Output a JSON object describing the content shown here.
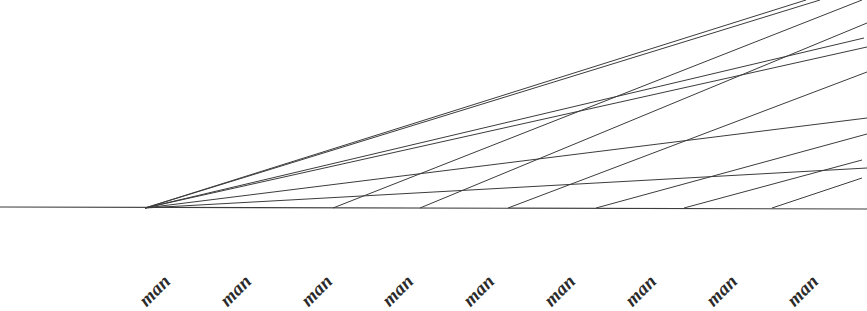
{
  "figure": {
    "title": "",
    "background_color": "#ffffff",
    "line_color": "#3c3c3c",
    "text_color": "#2b2b2b",
    "width": 867,
    "height": 289
  },
  "axis": {
    "name": "category-axis",
    "orientation": "horizontal",
    "baseline_y": 207,
    "label_rotation_deg": -45,
    "tick_labels": [
      {
        "text": "man",
        "x": 150,
        "y": 289
      },
      {
        "text": "man",
        "x": 231,
        "y": 289
      },
      {
        "text": "man",
        "x": 312,
        "y": 289
      },
      {
        "text": "man",
        "x": 393,
        "y": 289
      },
      {
        "text": "man",
        "x": 474,
        "y": 289
      },
      {
        "text": "man",
        "x": 555,
        "y": 289
      },
      {
        "text": "man",
        "x": 636,
        "y": 289
      },
      {
        "text": "man",
        "x": 717,
        "y": 289
      },
      {
        "text": "man",
        "x": 798,
        "y": 289
      }
    ]
  },
  "chart_data": {
    "type": "line",
    "title": "",
    "subtitle": "",
    "xlabel": "",
    "ylabel": "",
    "grid": false,
    "legend": "none",
    "xlim": [
      0,
      867
    ],
    "ylim": [
      0,
      289
    ],
    "categories": [
      "man",
      "man",
      "man",
      "man",
      "man",
      "man",
      "man",
      "man",
      "man"
    ],
    "series": [
      {
        "name": "baseline",
        "role": "axis-baseline",
        "points": [
          [
            0,
            207
          ],
          [
            867,
            209
          ]
        ]
      },
      {
        "name": "fan-line-1",
        "role": "near-horizontal-mesh",
        "points": [
          [
            145,
            208
          ],
          [
            867,
            168
          ]
        ]
      },
      {
        "name": "fan-line-2",
        "role": "near-horizontal-mesh",
        "points": [
          [
            145,
            208
          ],
          [
            867,
            118
          ]
        ]
      },
      {
        "name": "fan-line-3",
        "role": "near-horizontal-mesh",
        "points": [
          [
            145,
            208
          ],
          [
            867,
            47
          ]
        ]
      },
      {
        "name": "fan-line-4",
        "role": "near-horizontal-mesh",
        "points": [
          [
            145,
            208
          ],
          [
            864,
            38
          ]
        ]
      },
      {
        "name": "fan-line-5",
        "role": "near-horizontal-mesh-steep",
        "points": [
          [
            145,
            208
          ],
          [
            820,
            0
          ]
        ]
      },
      {
        "name": "fan-line-6",
        "role": "near-horizontal-mesh-steep",
        "points": [
          [
            145,
            208
          ],
          [
            806,
            0
          ]
        ]
      },
      {
        "name": "rib-line-1",
        "role": "steep-mesh",
        "points": [
          [
            333,
            208
          ],
          [
            862,
            0
          ]
        ]
      },
      {
        "name": "rib-line-2",
        "role": "steep-mesh",
        "points": [
          [
            420,
            208
          ],
          [
            867,
            23
          ]
        ]
      },
      {
        "name": "rib-line-3",
        "role": "steep-mesh",
        "points": [
          [
            508,
            208
          ],
          [
            867,
            72
          ]
        ]
      },
      {
        "name": "rib-line-4",
        "role": "steep-mesh",
        "points": [
          [
            596,
            208
          ],
          [
            867,
            134
          ]
        ]
      },
      {
        "name": "rib-line-5",
        "role": "steep-mesh",
        "points": [
          [
            684,
            208
          ],
          [
            862,
            160
          ]
        ]
      },
      {
        "name": "rib-line-6",
        "role": "steep-mesh",
        "points": [
          [
            772,
            208
          ],
          [
            862,
            178
          ]
        ]
      }
    ]
  }
}
